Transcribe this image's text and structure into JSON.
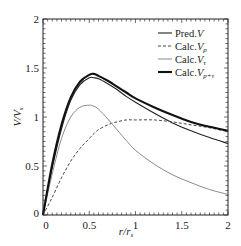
{
  "chart_data": {
    "type": "line",
    "title": "",
    "xlabel": "r/r_s",
    "ylabel": "V/V_s",
    "xlim": [
      0,
      2
    ],
    "ylim": [
      0,
      2
    ],
    "xticks": [
      "0",
      "0.5",
      "1",
      "1.5",
      "2"
    ],
    "yticks": [
      "0",
      "0.5",
      "1",
      "1.5",
      "2"
    ],
    "grid": false,
    "legend_position": "upper right",
    "x": [
      0,
      0.1,
      0.2,
      0.3,
      0.4,
      0.5,
      0.55,
      0.6,
      0.7,
      0.8,
      0.9,
      1.0,
      1.2,
      1.4,
      1.6,
      1.8,
      2.0
    ],
    "series": [
      {
        "name": "Pred.V",
        "style": "thin-solid-black",
        "values": [
          0,
          0.48,
          0.88,
          1.17,
          1.33,
          1.4,
          1.4,
          1.39,
          1.34,
          1.28,
          1.21,
          1.15,
          1.04,
          0.94,
          0.86,
          0.79,
          0.73
        ]
      },
      {
        "name": "Calc.V_p",
        "style": "dashed-black",
        "values": [
          0,
          0.18,
          0.38,
          0.55,
          0.68,
          0.78,
          0.83,
          0.87,
          0.92,
          0.95,
          0.97,
          0.97,
          0.97,
          0.95,
          0.92,
          0.89,
          0.85
        ]
      },
      {
        "name": "Calc.V_τ",
        "style": "thin-solid-gray",
        "values": [
          0,
          0.42,
          0.78,
          1.0,
          1.1,
          1.12,
          1.11,
          1.08,
          0.98,
          0.87,
          0.76,
          0.66,
          0.52,
          0.41,
          0.33,
          0.26,
          0.21
        ]
      },
      {
        "name": "Calc.V_p+τ",
        "style": "thick-solid-black",
        "values": [
          0,
          0.52,
          0.92,
          1.2,
          1.36,
          1.43,
          1.44,
          1.42,
          1.37,
          1.31,
          1.25,
          1.19,
          1.1,
          1.02,
          0.95,
          0.9,
          0.86
        ]
      }
    ]
  },
  "axes": {
    "xlabel_main": "r/r",
    "xlabel_sub": "s",
    "ylabel_main": "V/V",
    "ylabel_sub": "s",
    "origin_y_label": "0",
    "origin_x_label": "0"
  },
  "legend": [
    {
      "prefix": "Pred.",
      "var": "V",
      "sub": ""
    },
    {
      "prefix": "Calc.",
      "var": "V",
      "sub": "p"
    },
    {
      "prefix": "Calc.",
      "var": "V",
      "sub": "τ"
    },
    {
      "prefix": "Calc.",
      "var": "V",
      "sub": "p+τ"
    }
  ]
}
